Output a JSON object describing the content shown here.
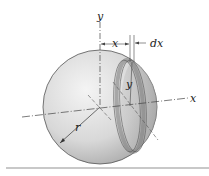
{
  "figure": {
    "labels": {
      "y_axis": "y",
      "x_axis": "x",
      "x_dist": "x",
      "dx": "dx",
      "slice_radius": "y",
      "radius": "r"
    },
    "colors": {
      "sphere_light": "#f2f2f2",
      "sphere_dark": "#9a9a9a",
      "slice_band": "#a8a8a8",
      "axis": "#444444",
      "rule": "#c8c8c8"
    }
  }
}
